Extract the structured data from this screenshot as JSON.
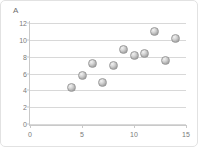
{
  "chart_data": {
    "type": "scatter",
    "title": "",
    "subtitle": "",
    "xlabel": "",
    "ylabel": "A",
    "xlim": [
      0,
      15
    ],
    "ylim": [
      0,
      12
    ],
    "grid": "horizontal",
    "legend": "none",
    "marker_style": "gray-sphere",
    "x_ticks": [
      0,
      5,
      10,
      15
    ],
    "y_ticks": [
      0,
      2,
      4,
      6,
      8,
      10,
      12
    ],
    "x_tick_labels": [
      "0",
      "5",
      "10",
      "15"
    ],
    "y_tick_labels": [
      "0",
      "2",
      "4",
      "6",
      "8",
      "10",
      "12"
    ],
    "series": [
      {
        "name": "A",
        "points": [
          {
            "x": 4,
            "y": 4.3
          },
          {
            "x": 5,
            "y": 5.8
          },
          {
            "x": 6,
            "y": 7.2
          },
          {
            "x": 7,
            "y": 4.9
          },
          {
            "x": 8,
            "y": 7.0
          },
          {
            "x": 9,
            "y": 8.9
          },
          {
            "x": 10,
            "y": 8.1
          },
          {
            "x": 11,
            "y": 8.4
          },
          {
            "x": 12,
            "y": 11.0
          },
          {
            "x": 13,
            "y": 7.6
          },
          {
            "x": 14,
            "y": 10.1
          }
        ]
      }
    ]
  },
  "colors": {
    "gridline": "#d8d8d8",
    "axis": "#c9c9c9",
    "tick_text": "#7a7a7a",
    "axis_title": "#6e6e6e",
    "marker_fill": "#c0c0c0",
    "marker_stroke": "#9a9a9a",
    "panel_background": "#ffffff",
    "panel_border": "#e2e2e2"
  }
}
